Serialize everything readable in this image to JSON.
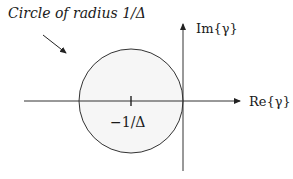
{
  "diagram": {
    "annotation": "Circle of radius 1/Δ",
    "y_axis_label": "Im{γ}",
    "x_axis_label": "Re{γ}",
    "center_label": "−1/Δ",
    "colors": {
      "stroke": "#222222",
      "fill_tint": "#f4f4f4"
    }
  }
}
